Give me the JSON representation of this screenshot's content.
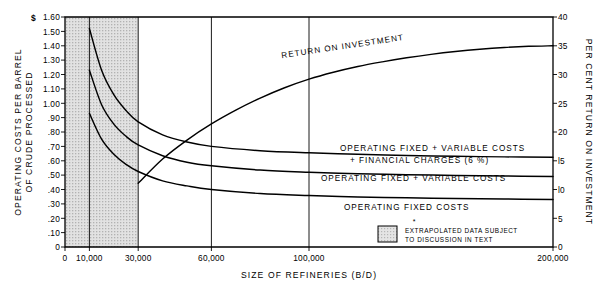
{
  "chart_data": {
    "type": "line",
    "title": "",
    "xlabel": "SIZE OF REFINERIES (B/D)",
    "ylabel_left_line1": "OPERATING COSTS PER BARREL",
    "ylabel_left_line2": "OF CRUDE PROCESSED",
    "ylabel_right": "PER CENT RETURN ON INVESTMENT",
    "left_axis_unit": "$",
    "xlim": [
      0,
      200000
    ],
    "ylim_left": [
      0,
      1.6
    ],
    "ylim_right": [
      0,
      40
    ],
    "grid": "vertical gridlines at 10,000 / 30,000 / 60,000 / 100,000",
    "legend_position": "inline curve labels, right of center",
    "xticks": [
      0,
      10000,
      30000,
      60000,
      100000,
      200000
    ],
    "xtick_labels": [
      "0",
      "10,000",
      "30,000",
      "60,000",
      "100,000",
      "200,000"
    ],
    "yticks_left": [
      0,
      0.1,
      0.2,
      0.3,
      0.4,
      0.5,
      0.6,
      0.7,
      0.8,
      0.9,
      1.0,
      1.1,
      1.2,
      1.3,
      1.4,
      1.5,
      1.6
    ],
    "ytick_labels_left": [
      "0",
      ".10",
      ".20",
      ".30",
      ".40",
      ".50",
      ".60",
      ".70",
      ".80",
      ".90",
      "1.00",
      "1.10",
      "1.20",
      "1.30",
      "1.40",
      "1.50",
      "1.60"
    ],
    "yticks_right": [
      0,
      5,
      10,
      15,
      20,
      25,
      30,
      35,
      40
    ],
    "ytick_labels_right": [
      "0",
      "5",
      "l0",
      "l5",
      "20",
      "25",
      "30",
      "35",
      "40"
    ],
    "gridline_x_values": [
      10000,
      30000,
      60000,
      100000
    ],
    "shaded_region": {
      "x_from": 0,
      "x_to": 30000,
      "meaning": "EXTRAPOLATED DATA SUBJECT TO DISCUSSION IN TEXT"
    },
    "series": [
      {
        "name": "RETURN ON INVESTMENT",
        "axis": "right",
        "units": "per cent",
        "label": "RETURN  ON  INVESTMENT",
        "points": [
          [
            30000,
            11.1
          ],
          [
            40000,
            15.3
          ],
          [
            50000,
            18.6
          ],
          [
            60000,
            21.4
          ],
          [
            70000,
            23.8
          ],
          [
            80000,
            25.9
          ],
          [
            90000,
            27.7
          ],
          [
            100000,
            29.2
          ],
          [
            110000,
            30.4
          ],
          [
            120000,
            31.4
          ],
          [
            130000,
            32.2
          ],
          [
            140000,
            32.9
          ],
          [
            150000,
            33.5
          ],
          [
            160000,
            34.0
          ],
          [
            170000,
            34.4
          ],
          [
            180000,
            34.7
          ],
          [
            190000,
            34.9
          ],
          [
            200000,
            35.0
          ]
        ]
      },
      {
        "name": "OPERATING FIXED + VARIABLE COSTS + FINANCIAL CHARGES (6%)",
        "axis": "left",
        "units": "dollars per barrel",
        "label_line1": "OPERATING  FIXED + VARIABLE  COSTS",
        "label_line2": "+  FINANCIAL  CHARGES  (6 %)",
        "points": [
          [
            10000,
            1.52
          ],
          [
            15000,
            1.23
          ],
          [
            20000,
            1.06
          ],
          [
            25000,
            0.95
          ],
          [
            30000,
            0.87
          ],
          [
            40000,
            0.78
          ],
          [
            50000,
            0.73
          ],
          [
            60000,
            0.7
          ],
          [
            80000,
            0.67
          ],
          [
            100000,
            0.655
          ],
          [
            120000,
            0.645
          ],
          [
            140000,
            0.637
          ],
          [
            160000,
            0.631
          ],
          [
            180000,
            0.627
          ],
          [
            200000,
            0.625
          ]
        ]
      },
      {
        "name": "OPERATING FIXED + VARIABLE COSTS",
        "axis": "left",
        "units": "dollars per barrel",
        "label": "OPERATING  FIXED +  VARIABLE  COSTS",
        "points": [
          [
            10000,
            1.23
          ],
          [
            15000,
            0.99
          ],
          [
            20000,
            0.855
          ],
          [
            25000,
            0.77
          ],
          [
            30000,
            0.71
          ],
          [
            40000,
            0.635
          ],
          [
            50000,
            0.59
          ],
          [
            60000,
            0.565
          ],
          [
            80000,
            0.535
          ],
          [
            100000,
            0.52
          ],
          [
            120000,
            0.51
          ],
          [
            140000,
            0.503
          ],
          [
            160000,
            0.498
          ],
          [
            180000,
            0.494
          ],
          [
            200000,
            0.49
          ]
        ]
      },
      {
        "name": "OPERATING FIXED COSTS",
        "axis": "left",
        "units": "dollars per barrel",
        "label": "OPERATING  FIXED  COSTS",
        "points": [
          [
            10000,
            0.93
          ],
          [
            15000,
            0.75
          ],
          [
            20000,
            0.645
          ],
          [
            25000,
            0.575
          ],
          [
            30000,
            0.525
          ],
          [
            40000,
            0.46
          ],
          [
            50000,
            0.425
          ],
          [
            60000,
            0.4
          ],
          [
            80000,
            0.372
          ],
          [
            100000,
            0.358
          ],
          [
            120000,
            0.348
          ],
          [
            140000,
            0.342
          ],
          [
            160000,
            0.337
          ],
          [
            180000,
            0.334
          ],
          [
            200000,
            0.33
          ]
        ]
      }
    ],
    "annotations": [
      {
        "name": "legend-asterisk",
        "text": "*"
      },
      {
        "name": "legend-note-line1",
        "text": "EXTRAPOLATED DATA SUBJECT"
      },
      {
        "name": "legend-note-line2",
        "text": "TO DISCUSSION IN TEXT"
      }
    ],
    "colors": {
      "ink": "#000000",
      "paper": "#ffffff",
      "shade": "#d5d5d5"
    }
  }
}
